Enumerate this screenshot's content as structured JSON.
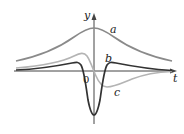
{
  "diagram": {
    "type": "function-curves",
    "axes": {
      "x_label": "t",
      "y_label": "y",
      "origin_label": "0"
    },
    "curves": [
      {
        "id": "a",
        "label": "a",
        "color": "#8a8a8a",
        "description": "bell-shaped curve, maximum at t=0"
      },
      {
        "id": "b",
        "label": "b",
        "color": "#b4b4b4",
        "description": "odd curve: positive max left of origin, zero at origin, negative min right of origin"
      },
      {
        "id": "c",
        "label": "c",
        "color": "#333333",
        "description": "even curve: deep minimum at t=0, small positive bumps on either side"
      }
    ],
    "colors": {
      "axis": "#444444",
      "background": "#ffffff"
    }
  }
}
